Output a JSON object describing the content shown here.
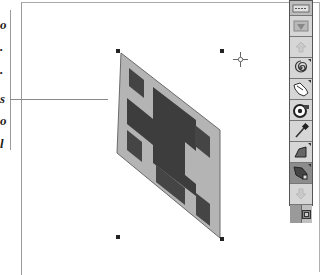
{
  "margin_text": {
    "glyphs": [
      "o",
      ".",
      ".",
      "s",
      "o",
      "l"
    ]
  },
  "canvas": {
    "selection_handles": [
      {
        "name": "top-left",
        "x": 116,
        "y": 49
      },
      {
        "name": "top-right",
        "x": 220,
        "y": 49
      },
      {
        "name": "bottom-left",
        "x": 116,
        "y": 235
      },
      {
        "name": "bottom-right",
        "x": 220,
        "y": 237
      }
    ],
    "shape": {
      "type": "skewed-parallelogram",
      "fill_outer": "#b0b0b0",
      "fill_inner": "#3f3f3f",
      "stroke": "#6a6a6a"
    },
    "cursor": {
      "type": "crosshair",
      "x": 240,
      "y": 60
    }
  },
  "palette": {
    "tools": [
      {
        "name": "lasso-select",
        "state": "normal"
      },
      {
        "name": "arrow-up",
        "state": "dim"
      },
      {
        "name": "spiral",
        "state": "normal"
      },
      {
        "name": "hand-pan",
        "state": "normal"
      },
      {
        "name": "camera-snapshot",
        "state": "normal"
      },
      {
        "name": "eyedropper",
        "state": "normal"
      },
      {
        "name": "shape-tool",
        "state": "normal"
      },
      {
        "name": "distort-tool",
        "state": "selected"
      },
      {
        "name": "arrow-down",
        "state": "dim"
      }
    ],
    "colors": {
      "foreground": "#9a9a9a",
      "background": "#c0c0c0"
    }
  }
}
